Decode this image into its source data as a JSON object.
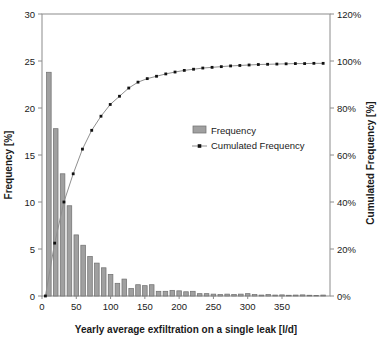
{
  "figure": {
    "background": "#ffffff"
  },
  "colors": {
    "bar_fill": "#a0a0a0",
    "bar_stroke": "#737373",
    "curve_line": "#8f8f8f",
    "curve_marker": "#111111",
    "axis_line": "#8c8c8c",
    "text": "#1a1a1a"
  },
  "chart_data": {
    "type": "bar",
    "subtype": "pareto-histogram-with-cumulative-line",
    "title": "",
    "xlabel": "Yearly average exfiltration on a single leak [l/d]",
    "ylabel_left": "Frequency [%]",
    "ylabel_right": "Cumulated Frequency [%]",
    "xlim": [
      0,
      420
    ],
    "ylim_left": [
      0,
      30
    ],
    "ylim_right": [
      0,
      120
    ],
    "grid": "off",
    "legend_position": "inside-upper-middle",
    "legend": [
      {
        "label": "Frequency",
        "marker": "gray-bar-swatch"
      },
      {
        "label": "Cumulated Frequency",
        "marker": "black-square-on-line"
      }
    ],
    "x_ticks": [
      {
        "v": 0,
        "label": "0"
      },
      {
        "v": 50,
        "label": "50"
      },
      {
        "v": 100,
        "label": "100"
      },
      {
        "v": 150,
        "label": "150"
      },
      {
        "v": 200,
        "label": "200"
      },
      {
        "v": 250,
        "label": "250"
      },
      {
        "v": 300,
        "label": "300"
      },
      {
        "v": 350,
        "label": "350"
      }
    ],
    "y_left_ticks": [
      {
        "v": 0,
        "label": "0"
      },
      {
        "v": 5,
        "label": "5"
      },
      {
        "v": 10,
        "label": "10"
      },
      {
        "v": 15,
        "label": "15"
      },
      {
        "v": 20,
        "label": "20"
      },
      {
        "v": 25,
        "label": "25"
      },
      {
        "v": 30,
        "label": "30"
      }
    ],
    "y_right_ticks": [
      {
        "v": 0,
        "label": "0%"
      },
      {
        "v": 20,
        "label": "20%"
      },
      {
        "v": 40,
        "label": "40%"
      },
      {
        "v": 60,
        "label": "60%"
      },
      {
        "v": 80,
        "label": "80%"
      },
      {
        "v": 100,
        "label": "100%"
      },
      {
        "v": 120,
        "label": "120%"
      }
    ],
    "bars": {
      "bin_width": 10,
      "centers": [
        10,
        20,
        30,
        40,
        50,
        60,
        70,
        80,
        90,
        100,
        110,
        120,
        130,
        140,
        150,
        160,
        170,
        180,
        190,
        200,
        210,
        220,
        230,
        240,
        250,
        260,
        270,
        280,
        290,
        300,
        310,
        320,
        330,
        340,
        350,
        360,
        370,
        380,
        390,
        400,
        410
      ],
      "frequency_pct": [
        23.8,
        17.8,
        13.0,
        9.6,
        6.5,
        5.4,
        4.2,
        3.5,
        3.0,
        2.3,
        1.35,
        1.8,
        0.8,
        1.2,
        1.1,
        1.2,
        0.5,
        0.5,
        0.6,
        0.55,
        0.45,
        0.5,
        0.25,
        0.25,
        0.2,
        0.15,
        0.2,
        0.15,
        0.2,
        0.25,
        0.15,
        0.1,
        0.15,
        0.1,
        0.12,
        0.08,
        0.1,
        0.12,
        0.08,
        0.06,
        0.1
      ]
    },
    "cumulative": {
      "x": [
        5,
        18.5,
        32,
        45.5,
        59,
        72.5,
        86,
        99.5,
        113,
        126.5,
        140,
        153.5,
        167,
        180.5,
        194,
        207.5,
        221,
        234.5,
        248,
        261.5,
        275,
        288.5,
        302,
        315.5,
        329,
        342.5,
        356,
        369.5,
        383,
        396.5,
        410
      ],
      "pct": [
        0,
        22.5,
        40,
        52,
        62.5,
        70.5,
        76.5,
        81.5,
        85,
        88.5,
        91,
        92.5,
        93.5,
        94.5,
        95.3,
        96,
        96.5,
        97,
        97.3,
        97.6,
        97.9,
        98.1,
        98.3,
        98.5,
        98.6,
        98.7,
        98.8,
        98.9,
        98.9,
        99,
        99
      ]
    }
  }
}
